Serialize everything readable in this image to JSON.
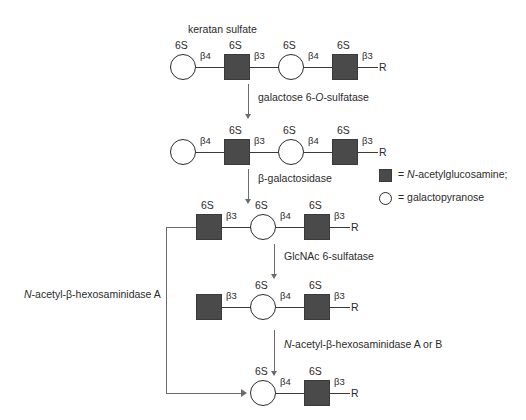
{
  "diagram": {
    "title": "keratan sulfate",
    "sulfate_label": "6S",
    "terminal_label": "R",
    "linkage_beta4": "β4",
    "linkage_beta3": "β3"
  },
  "enzymes": {
    "step1": {
      "text": "galactose 6-O-sulfatase",
      "pre": "galactose 6-",
      "italic": "O",
      "post": "-sulfatase"
    },
    "step2": {
      "text": "β-galactosidase"
    },
    "step3": {
      "text": "GlcNAc 6-sulfatase"
    },
    "step4": {
      "text": "N-acetyl-β-hexosaminidase A or B",
      "italic": "N",
      "post": "-acetyl-β-hexosaminidase A or B"
    },
    "recycle": {
      "text": "N-acetyl-β-hexosaminidase A",
      "italic": "N",
      "post": "-acetyl-β-hexosaminidase A"
    }
  },
  "legend": {
    "square": {
      "equals": "= ",
      "italic": "N",
      "post": "-acetylglucosamine;"
    },
    "circle": {
      "equals": "= ",
      "post": "galactopyranose"
    }
  },
  "rows": [
    {
      "name": "row-1-keratan-sulfate",
      "units": [
        {
          "shape": "circle",
          "sulfate": "6S",
          "link": "β4"
        },
        {
          "shape": "square",
          "sulfate": "6S",
          "link": "β3"
        },
        {
          "shape": "circle",
          "sulfate": "6S",
          "link": "β4"
        },
        {
          "shape": "square",
          "sulfate": "6S",
          "link": "β3"
        }
      ],
      "terminal": "R"
    },
    {
      "name": "row-2-gal-desulfated",
      "units": [
        {
          "shape": "circle",
          "sulfate": "",
          "link": "β4"
        },
        {
          "shape": "square",
          "sulfate": "6S",
          "link": "β3"
        },
        {
          "shape": "circle",
          "sulfate": "6S",
          "link": "β4"
        },
        {
          "shape": "square",
          "sulfate": "6S",
          "link": "β3"
        }
      ],
      "terminal": "R"
    },
    {
      "name": "row-3-gal-removed",
      "units": [
        {
          "shape": "square",
          "sulfate": "6S",
          "link": "β3"
        },
        {
          "shape": "circle",
          "sulfate": "6S",
          "link": "β4"
        },
        {
          "shape": "square",
          "sulfate": "6S",
          "link": "β3"
        }
      ],
      "terminal": "R"
    },
    {
      "name": "row-4-glcnac-desulfated",
      "units": [
        {
          "shape": "square",
          "sulfate": "",
          "link": "β3"
        },
        {
          "shape": "circle",
          "sulfate": "6S",
          "link": "β4"
        },
        {
          "shape": "square",
          "sulfate": "6S",
          "link": "β3"
        }
      ],
      "terminal": "R"
    },
    {
      "name": "row-5-glcnac-removed",
      "units": [
        {
          "shape": "circle",
          "sulfate": "6S",
          "link": "β4"
        },
        {
          "shape": "square",
          "sulfate": "6S",
          "link": "β3"
        }
      ],
      "terminal": "R"
    }
  ],
  "colors": {
    "glcnac_square": "#4a4a4a",
    "galactose_circle_outline": "#2b2b2b",
    "arrow": "#6b6b6b",
    "text": "#2b2b2b",
    "background": "#ffffff"
  }
}
